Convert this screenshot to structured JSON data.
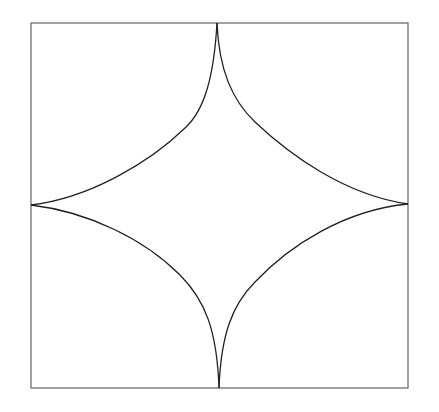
{
  "diagram": {
    "type": "geometric-figure",
    "colors": {
      "background": "#ffffff",
      "frame_stroke": "#6e6e6e",
      "curve_stroke": "#222222"
    },
    "frame": {
      "x": 31,
      "y": 23,
      "width": 377,
      "height": 365
    },
    "cusps": {
      "top": [
        217,
        23
      ],
      "right": [
        408,
        204
      ],
      "bottom": [
        219,
        388
      ],
      "left": [
        31,
        205
      ]
    }
  }
}
